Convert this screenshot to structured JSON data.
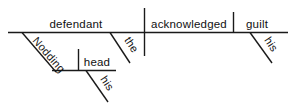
{
  "diagram": {
    "type": "reed-kellogg-sentence-diagram",
    "sentence": "Nodding his head, the defendant acknowledged his guilt.",
    "ink_color": "#1a1a1a",
    "background_color": "#ffffff",
    "main_clause": {
      "subject": "defendant",
      "verb": "acknowledged",
      "object": "guilt"
    },
    "labels": {
      "subject": "defendant",
      "verb": "acknowledged",
      "object": "guilt",
      "subject_article": "the",
      "object_possessive": "his",
      "participle": "Nodding",
      "participle_object": "head",
      "participle_possessive": "his"
    }
  }
}
